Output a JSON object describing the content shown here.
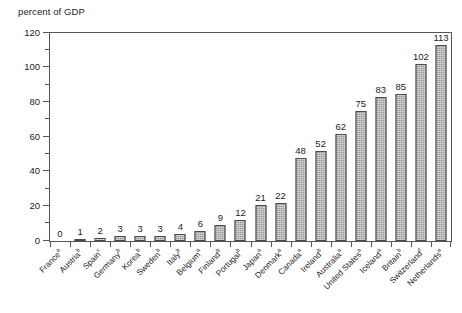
{
  "chart_data": {
    "type": "bar",
    "title": "percent of GDP",
    "xlabel": "",
    "ylabel": "percent of GDP",
    "ylim": [
      0,
      120
    ],
    "ytick_step": 20,
    "yminor_step": 10,
    "grid": false,
    "legend": null,
    "categories": [
      "France",
      "Austria",
      "Spain",
      "Germany",
      "Korea",
      "Sweden",
      "Italy",
      "Belgium",
      "Finland",
      "Portugal",
      "Japan",
      "Denmark",
      "Canada",
      "Ireland",
      "Australia",
      "United States",
      "Iceland",
      "Britain",
      "Switzerland",
      "Netherlands"
    ],
    "category_footnotes": [
      "a",
      "b",
      "c",
      "b",
      "b",
      "b",
      "b",
      "a",
      "b",
      "b",
      "a",
      "a",
      "a",
      "b",
      "a",
      "a",
      "a",
      "b",
      "f",
      "a"
    ],
    "values": [
      0,
      1,
      2,
      3,
      3,
      3,
      4,
      6,
      9,
      12,
      21,
      22,
      48,
      52,
      62,
      75,
      83,
      85,
      102,
      113
    ],
    "value_labels": [
      "0",
      "1",
      "2",
      "3",
      "3",
      "3",
      "4",
      "6",
      "9",
      "12",
      "21",
      "22",
      "48",
      "52",
      "62",
      "75",
      "83",
      "85",
      "102",
      "113"
    ],
    "ytick_labels": [
      "0",
      "20",
      "40",
      "60",
      "80",
      "100",
      "120"
    ],
    "bar_color": "#9a9a9a",
    "bar_edge_color": "#4a4b4f",
    "axis_color": "#55565a",
    "text_color": "#1c1c1c",
    "background_color": "#ffffff"
  }
}
